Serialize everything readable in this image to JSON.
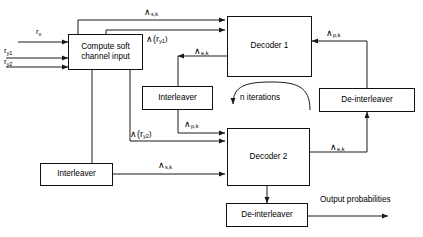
{
  "diagram": {
    "background_color": "#ffffff",
    "line_color": "#1a1a1a",
    "text_color": "#000000",
    "width": 423,
    "height": 237
  },
  "blocks": {
    "compute_soft": {
      "line1": "Compute soft",
      "line2": "channel input"
    },
    "decoder1": {
      "label": "Decoder 1"
    },
    "decoder2": {
      "label": "Decoder 2"
    },
    "interleaver_mid": {
      "label": "Interleaver"
    },
    "interleaver_bottom": {
      "label": "Interleaver"
    },
    "deinterleaver_right": {
      "label": "De-interleaver"
    },
    "deinterleaver_bottom": {
      "label": "De-interleaver"
    }
  },
  "inputs": {
    "rx": {
      "base": "r",
      "sub": "x"
    },
    "ry1": {
      "base": "r",
      "sub": "y1"
    },
    "ry2": {
      "base": "r",
      "sub": "y2"
    }
  },
  "signals": {
    "lambda_s_k_top": {
      "base": "∧",
      "sub": "s,k"
    },
    "lambda_ry1": {
      "text": "∧(r",
      "sub": "y1",
      "tail": ")"
    },
    "lambda_e_k_d1": {
      "base": "∧",
      "sub": "e,k"
    },
    "lambda_p_k_right": {
      "base": "∧",
      "sub": "p,k"
    },
    "lambda_p_k_mid": {
      "base": "∧",
      "sub": "p,k"
    },
    "lambda_ry2": {
      "text": "∧(r",
      "sub": "y2",
      "tail": ")"
    },
    "lambda_s_k_bottom": {
      "base": "∧",
      "sub": "s,k"
    },
    "lambda_e_k_d2": {
      "base": "∧",
      "sub": "e,k"
    }
  },
  "annotations": {
    "n_iterations": "n iterations",
    "output_probabilities": "Output probabilities"
  }
}
